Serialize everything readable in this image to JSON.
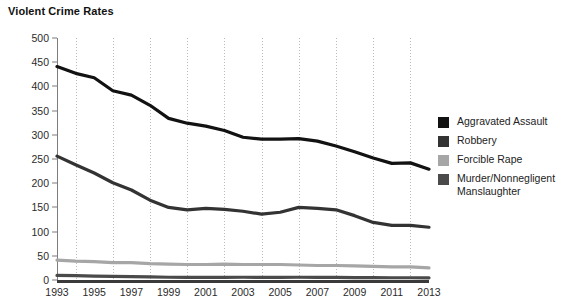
{
  "title": "Violent Crime Rates",
  "legend": {
    "items": [
      {
        "label": "Aggravated Assault",
        "color": "#121212"
      },
      {
        "label": "Robbery",
        "color": "#333333"
      },
      {
        "label": "Forcible Rape",
        "color": "#a6a6a6"
      },
      {
        "label": "Murder/Nonnegligent Manslaughter",
        "color": "#4a4a4a"
      }
    ]
  },
  "axis": {
    "y_ticks": [
      0,
      50,
      100,
      150,
      200,
      250,
      300,
      350,
      400,
      450,
      500
    ],
    "x_ticks": [
      1993,
      1995,
      1997,
      1999,
      2001,
      2003,
      2005,
      2007,
      2009,
      2011,
      2013
    ]
  },
  "chart_data": {
    "type": "line",
    "title": "Violent Crime Rates",
    "xlabel": "",
    "ylabel": "",
    "xlim": [
      1993,
      2013
    ],
    "ylim": [
      0,
      500
    ],
    "grid": true,
    "legend_position": "right",
    "x": [
      1993,
      1994,
      1995,
      1996,
      1997,
      1998,
      1999,
      2000,
      2001,
      2002,
      2003,
      2004,
      2005,
      2006,
      2007,
      2008,
      2009,
      2010,
      2011,
      2012,
      2013
    ],
    "series": [
      {
        "name": "Aggravated Assault",
        "color": "#121212",
        "values": [
          441,
          427,
          418,
          391,
          382,
          361,
          334,
          324,
          318,
          309,
          295,
          291,
          291,
          292,
          287,
          277,
          265,
          252,
          241,
          242,
          229
        ]
      },
      {
        "name": "Robbery",
        "color": "#333333",
        "values": [
          256,
          238,
          221,
          201,
          186,
          165,
          150,
          145,
          148,
          146,
          142,
          136,
          140,
          150,
          148,
          145,
          133,
          119,
          113,
          113,
          109
        ]
      },
      {
        "name": "Forcible Rape",
        "color": "#a6a6a6",
        "values": [
          41,
          39,
          38,
          36,
          36,
          34,
          33,
          32,
          32,
          33,
          32,
          32,
          32,
          31,
          30,
          30,
          29,
          28,
          27,
          27,
          25
        ]
      },
      {
        "name": "Murder/Nonnegligent Manslaughter",
        "color": "#4a4a4a",
        "values": [
          9.5,
          9,
          8.2,
          7.4,
          6.8,
          6.3,
          5.7,
          5.5,
          5.6,
          5.6,
          5.7,
          5.5,
          5.6,
          5.7,
          5.6,
          5.4,
          5,
          4.8,
          4.7,
          4.7,
          4.5
        ]
      }
    ]
  }
}
